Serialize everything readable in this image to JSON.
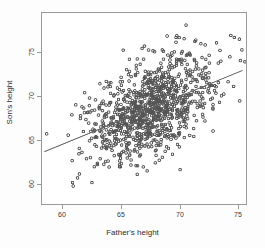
{
  "chart_data": {
    "type": "scatter",
    "title": "",
    "xlabel": "Father's height",
    "ylabel": "Son's height",
    "xlim": [
      58.5,
      75.8
    ],
    "ylim": [
      58.5,
      78.8
    ],
    "xticks": [
      60,
      65,
      70,
      75
    ],
    "yticks": [
      60,
      65,
      70,
      75
    ],
    "xticklabels": [
      "60",
      "65",
      "70",
      "75"
    ],
    "yticklabels": [
      "60",
      "65",
      "70",
      "75"
    ],
    "grid": false,
    "legend": null,
    "marker": "open-circle",
    "marker_color": "#555555",
    "marker_size": 2.6,
    "n_points": 1078,
    "series": [
      {
        "name": "father-son heights",
        "x_mean": 67.7,
        "y_mean": 68.7,
        "x_sd": 2.74,
        "y_sd": 2.81,
        "correlation": 0.501
      }
    ],
    "annotations": [
      {
        "type": "regression-line",
        "name": "least-squares-fit",
        "color": "#666666",
        "slope": 0.514,
        "intercept": 33.89,
        "x_start": 58.7,
        "y_start": 64.06,
        "x_end": 75.5,
        "y_end": 72.69
      }
    ]
  },
  "axes": {
    "x_tick_labels": [
      "60",
      "65",
      "70",
      "75"
    ],
    "y_tick_labels": [
      "60",
      "65",
      "70",
      "75"
    ],
    "x_axis_title": "Father's height",
    "y_axis_title": "Son's height"
  }
}
